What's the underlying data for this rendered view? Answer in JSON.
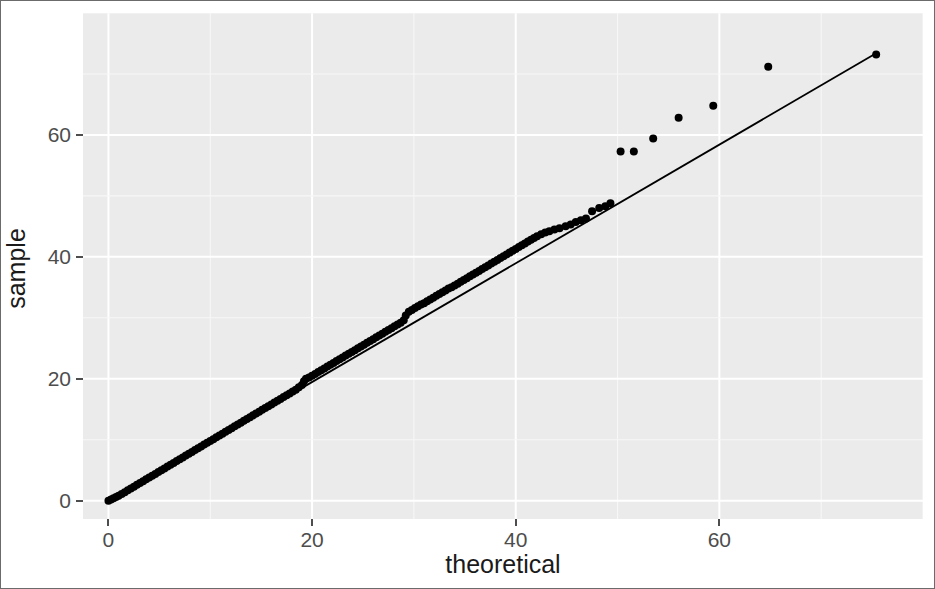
{
  "chart_data": {
    "type": "scatter",
    "title": "",
    "subtitle": "",
    "xlabel": "theoretical",
    "ylabel": "sample",
    "xlim": [
      -2.5,
      80.0
    ],
    "ylim": [
      -3.0,
      80.0
    ],
    "xticks": [
      0,
      20,
      40,
      60
    ],
    "xtick_labels": [
      "0",
      "20",
      "40",
      "60"
    ],
    "yticks": [
      0,
      20,
      40,
      60
    ],
    "ytick_labels": [
      "0",
      "20",
      "40",
      "60"
    ],
    "grid": true,
    "grid_major_color": "#ffffff",
    "grid_minor_color": "#f7f7f7",
    "panel_background": "#ebebeb",
    "legend": null,
    "legend_position": "none",
    "point_color": "#000000",
    "point_size": 4.0,
    "line_color": "#000000",
    "line_width": 1.8,
    "reference_line": {
      "name": "qq-reference-line",
      "x0": 0.0,
      "y0": 0.0,
      "x1": 75.4,
      "y1": 73.4
    },
    "series": [
      {
        "name": "qq-points",
        "points": [
          [
            0.0,
            0.0
          ],
          [
            0.25,
            0.2
          ],
          [
            0.5,
            0.4
          ],
          [
            0.75,
            0.6
          ],
          [
            1.0,
            0.8
          ],
          [
            1.3,
            1.1
          ],
          [
            1.6,
            1.4
          ],
          [
            1.9,
            1.7
          ],
          [
            2.2,
            2.0
          ],
          [
            2.5,
            2.3
          ],
          [
            2.8,
            2.6
          ],
          [
            3.1,
            2.9
          ],
          [
            3.4,
            3.2
          ],
          [
            3.7,
            3.5
          ],
          [
            4.0,
            3.8
          ],
          [
            4.3,
            4.1
          ],
          [
            4.6,
            4.4
          ],
          [
            4.9,
            4.7
          ],
          [
            5.2,
            5.0
          ],
          [
            5.5,
            5.3
          ],
          [
            5.8,
            5.6
          ],
          [
            6.1,
            5.9
          ],
          [
            6.4,
            6.2
          ],
          [
            6.7,
            6.5
          ],
          [
            7.0,
            6.8
          ],
          [
            7.3,
            7.1
          ],
          [
            7.6,
            7.4
          ],
          [
            7.9,
            7.7
          ],
          [
            8.2,
            8.0
          ],
          [
            8.5,
            8.3
          ],
          [
            8.8,
            8.6
          ],
          [
            9.1,
            8.9
          ],
          [
            9.4,
            9.2
          ],
          [
            9.7,
            9.5
          ],
          [
            10.0,
            9.8
          ],
          [
            10.3,
            10.1
          ],
          [
            10.6,
            10.4
          ],
          [
            10.9,
            10.7
          ],
          [
            11.2,
            11.0
          ],
          [
            11.5,
            11.3
          ],
          [
            11.8,
            11.6
          ],
          [
            12.1,
            11.9
          ],
          [
            12.4,
            12.2
          ],
          [
            12.7,
            12.5
          ],
          [
            13.0,
            12.8
          ],
          [
            13.3,
            13.1
          ],
          [
            13.6,
            13.4
          ],
          [
            13.9,
            13.7
          ],
          [
            14.2,
            14.0
          ],
          [
            14.5,
            14.3
          ],
          [
            14.8,
            14.6
          ],
          [
            15.1,
            14.9
          ],
          [
            15.4,
            15.2
          ],
          [
            15.7,
            15.5
          ],
          [
            16.0,
            15.8
          ],
          [
            16.3,
            16.1
          ],
          [
            16.6,
            16.4
          ],
          [
            16.9,
            16.7
          ],
          [
            17.2,
            17.0
          ],
          [
            17.5,
            17.3
          ],
          [
            17.8,
            17.6
          ],
          [
            18.1,
            17.9
          ],
          [
            18.4,
            18.2
          ],
          [
            18.7,
            18.6
          ],
          [
            19.0,
            19.0
          ],
          [
            19.2,
            19.6
          ],
          [
            19.4,
            20.0
          ],
          [
            19.7,
            20.2
          ],
          [
            20.0,
            20.5
          ],
          [
            20.3,
            20.8
          ],
          [
            20.6,
            21.1
          ],
          [
            20.9,
            21.4
          ],
          [
            21.2,
            21.7
          ],
          [
            21.5,
            22.0
          ],
          [
            21.8,
            22.3
          ],
          [
            22.1,
            22.6
          ],
          [
            22.4,
            22.9
          ],
          [
            22.7,
            23.2
          ],
          [
            23.0,
            23.5
          ],
          [
            23.3,
            23.8
          ],
          [
            23.6,
            24.1
          ],
          [
            23.9,
            24.4
          ],
          [
            24.2,
            24.7
          ],
          [
            24.5,
            25.0
          ],
          [
            24.8,
            25.3
          ],
          [
            25.1,
            25.6
          ],
          [
            25.4,
            25.9
          ],
          [
            25.7,
            26.2
          ],
          [
            26.0,
            26.5
          ],
          [
            26.3,
            26.8
          ],
          [
            26.6,
            27.1
          ],
          [
            26.9,
            27.4
          ],
          [
            27.2,
            27.7
          ],
          [
            27.5,
            28.0
          ],
          [
            27.8,
            28.3
          ],
          [
            28.1,
            28.6
          ],
          [
            28.4,
            28.9
          ],
          [
            28.7,
            29.2
          ],
          [
            29.0,
            29.6
          ],
          [
            29.2,
            30.4
          ],
          [
            29.5,
            31.0
          ],
          [
            29.8,
            31.3
          ],
          [
            30.1,
            31.6
          ],
          [
            30.4,
            31.9
          ],
          [
            30.7,
            32.2
          ],
          [
            31.0,
            32.4
          ],
          [
            31.3,
            32.7
          ],
          [
            31.6,
            33.0
          ],
          [
            31.9,
            33.3
          ],
          [
            32.2,
            33.6
          ],
          [
            32.5,
            33.9
          ],
          [
            32.8,
            34.2
          ],
          [
            33.1,
            34.5
          ],
          [
            33.4,
            34.8
          ],
          [
            33.7,
            35.0
          ],
          [
            34.0,
            35.3
          ],
          [
            34.3,
            35.6
          ],
          [
            34.6,
            35.9
          ],
          [
            34.9,
            36.2
          ],
          [
            35.2,
            36.5
          ],
          [
            35.5,
            36.8
          ],
          [
            35.8,
            37.1
          ],
          [
            36.1,
            37.4
          ],
          [
            36.4,
            37.7
          ],
          [
            36.7,
            38.0
          ],
          [
            37.0,
            38.3
          ],
          [
            37.3,
            38.6
          ],
          [
            37.6,
            38.9
          ],
          [
            37.9,
            39.2
          ],
          [
            38.2,
            39.5
          ],
          [
            38.5,
            39.8
          ],
          [
            38.8,
            40.1
          ],
          [
            39.1,
            40.4
          ],
          [
            39.4,
            40.7
          ],
          [
            39.7,
            41.0
          ],
          [
            40.0,
            41.3
          ],
          [
            40.3,
            41.6
          ],
          [
            40.6,
            41.9
          ],
          [
            40.9,
            42.2
          ],
          [
            41.2,
            42.5
          ],
          [
            41.5,
            42.8
          ],
          [
            41.8,
            43.1
          ],
          [
            42.1,
            43.4
          ],
          [
            42.5,
            43.7
          ],
          [
            42.9,
            44.0
          ],
          [
            43.3,
            44.2
          ],
          [
            43.8,
            44.5
          ],
          [
            44.3,
            44.7
          ],
          [
            44.9,
            45.0
          ],
          [
            45.4,
            45.3
          ],
          [
            45.9,
            45.7
          ],
          [
            46.4,
            46.0
          ],
          [
            46.9,
            46.3
          ],
          [
            47.5,
            47.5
          ],
          [
            48.2,
            48.0
          ],
          [
            48.8,
            48.3
          ],
          [
            49.3,
            48.8
          ],
          [
            50.3,
            57.3
          ],
          [
            51.6,
            57.3
          ],
          [
            53.5,
            59.4
          ],
          [
            56.0,
            62.8
          ],
          [
            59.4,
            64.8
          ],
          [
            64.8,
            71.2
          ],
          [
            75.4,
            73.2
          ]
        ]
      }
    ]
  },
  "axes": {
    "x": {
      "title": "theoretical",
      "ticks": [
        {
          "value": 0,
          "label": "0"
        },
        {
          "value": 20,
          "label": "20"
        },
        {
          "value": 40,
          "label": "40"
        },
        {
          "value": 60,
          "label": "60"
        }
      ]
    },
    "y": {
      "title": "sample",
      "ticks": [
        {
          "value": 0,
          "label": "0"
        },
        {
          "value": 20,
          "label": "20"
        },
        {
          "value": 40,
          "label": "40"
        },
        {
          "value": 60,
          "label": "60"
        }
      ]
    }
  }
}
